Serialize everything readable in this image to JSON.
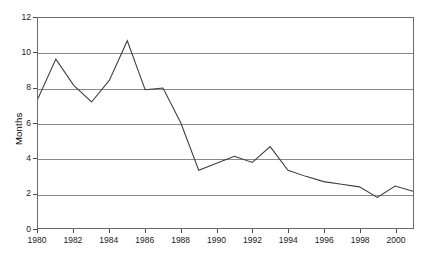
{
  "chart_data": {
    "type": "line",
    "title": "",
    "subtitle": "",
    "xlabel": "",
    "ylabel": "Months",
    "xlim": [
      1980,
      2001
    ],
    "ylim": [
      0,
      12
    ],
    "y_ticks": [
      0,
      2,
      4,
      6,
      8,
      10,
      12
    ],
    "x_ticks": [
      1980,
      1982,
      1984,
      1986,
      1988,
      1990,
      1992,
      1994,
      1996,
      1998,
      2000
    ],
    "x_tick_labels": [
      "1980",
      "1982",
      "1984",
      "1986",
      "1988",
      "1990",
      "1992",
      "1994",
      "1996",
      "1998",
      "2000"
    ],
    "y_tick_labels": [
      "0",
      "2",
      "4",
      "6",
      "8",
      "10",
      "12"
    ],
    "grid": "horizontal",
    "legend": "none",
    "x": [
      1980,
      1981,
      1982,
      1983,
      1984,
      1985,
      1986,
      1987,
      1988,
      1989,
      1990,
      1991,
      1992,
      1993,
      1994,
      1995,
      1996,
      1997,
      1998,
      1999,
      2000,
      2001
    ],
    "series": [
      {
        "name": "Months",
        "color": "#3d3d3d",
        "values": [
          7.4,
          9.65,
          8.15,
          7.2,
          8.45,
          10.7,
          7.9,
          8.0,
          6.0,
          3.3,
          3.7,
          4.1,
          3.75,
          4.65,
          3.3,
          2.95,
          2.65,
          2.5,
          2.35,
          1.75,
          2.4,
          2.1
        ]
      }
    ],
    "annotations": []
  },
  "colors": {
    "background": "#ffffff",
    "plot_border": "#6b6b6b",
    "gridline": "#8a8a8a",
    "series_line": "#3d3d3d",
    "tick_text": "#1a1a1a",
    "tick_mark": "#4a4a4a"
  }
}
